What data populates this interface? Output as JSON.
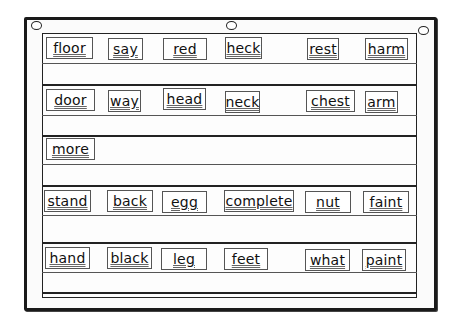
{
  "pocket_chart": {
    "rows": [
      {
        "cards": [
          {
            "word": "floor",
            "x": 46,
            "w": 47
          },
          {
            "word": "say",
            "x": 108,
            "w": 35
          },
          {
            "word": "red",
            "x": 163,
            "w": 44
          },
          {
            "word": "heck",
            "x": 225,
            "w": 37
          },
          {
            "word": "rest",
            "x": 307,
            "w": 32
          },
          {
            "word": "harm",
            "x": 365,
            "w": 43
          }
        ],
        "top": 37
      },
      {
        "cards": [
          {
            "word": "door",
            "x": 46,
            "w": 49
          },
          {
            "word": "way",
            "x": 108,
            "w": 33
          },
          {
            "word": "head",
            "x": 163,
            "w": 43
          },
          {
            "word": "neck",
            "x": 225,
            "w": 35
          },
          {
            "word": "chest",
            "x": 306,
            "w": 49
          },
          {
            "word": "arm",
            "x": 365,
            "w": 33
          }
        ],
        "top": 89
      },
      {
        "cards": [
          {
            "word": "more",
            "x": 46,
            "w": 49
          }
        ],
        "top": 139
      },
      {
        "cards": [
          {
            "word": "stand",
            "x": 44,
            "w": 47
          },
          {
            "word": "back",
            "x": 107,
            "w": 46
          },
          {
            "word": "egg",
            "x": 162,
            "w": 45
          },
          {
            "word": "complete",
            "x": 224,
            "w": 70
          },
          {
            "word": "nut",
            "x": 305,
            "w": 46
          },
          {
            "word": "faint",
            "x": 363,
            "w": 46
          }
        ],
        "top": 190
      },
      {
        "cards": [
          {
            "word": "hand",
            "x": 45,
            "w": 45
          },
          {
            "word": "black",
            "x": 107,
            "w": 45
          },
          {
            "word": "leg",
            "x": 161,
            "w": 46
          },
          {
            "word": "feet",
            "x": 224,
            "w": 44
          },
          {
            "word": "what",
            "x": 305,
            "w": 45
          },
          {
            "word": "paint",
            "x": 362,
            "w": 44
          }
        ],
        "top": 247
      }
    ]
  },
  "labels": {
    "r0": [
      "floor",
      "say",
      "red",
      "heck",
      "rest",
      "harm"
    ],
    "r1": [
      "door",
      "way",
      "head",
      "neck",
      "chest",
      "arm"
    ],
    "r2": [
      "more"
    ],
    "r3": [
      "stand",
      "back",
      "egg",
      "complete",
      "nut",
      "faint"
    ],
    "r4": [
      "hand",
      "black",
      "leg",
      "feet",
      "what",
      "paint"
    ]
  }
}
